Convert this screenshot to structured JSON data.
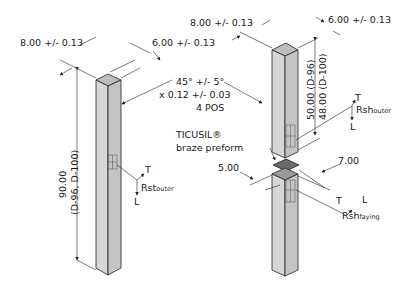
{
  "left_bar": {
    "dim_width": "8.00 +/- 0.13",
    "dim_depth": "6.00 +/- 0.13",
    "dim_length_value": "90.00",
    "dim_length_variants": "(D-96, D-100)",
    "gauge_axes": {
      "t": "T",
      "l": "L"
    },
    "gauge_label": "Rst",
    "gauge_sub": "outer"
  },
  "chamfer_note": {
    "line1": "45° +/- 5°",
    "line2": "x 0.12 +/- 0.03",
    "line3": "4 POS"
  },
  "right_assembly": {
    "dim_width": "8.00 +/- 0.13",
    "dim_depth": "6.00 +/- 0.13",
    "dim_upper_length_1": "50.00 (D-96)",
    "dim_upper_length_2": "48.00 (D-100)",
    "upper_gauge_axes": {
      "t": "T",
      "l": "L"
    },
    "upper_gauge_label": "Rsh",
    "upper_gauge_sub": "outer",
    "preform_label_line1": "TICUSIL®",
    "preform_label_line2": "braze preform",
    "dim_preform_a": "7.00",
    "dim_preform_b": "5.00",
    "lower_gauge_axes": {
      "t": "T",
      "l": "L"
    },
    "lower_gauge_label": "Rsh",
    "lower_gauge_sub": "faying"
  },
  "colors": {
    "bar_front": "#d4d4d4",
    "bar_side": "#c2c2c2",
    "bar_top": "#bdbdbd",
    "preform": "#6a6a6a",
    "line": "#222222"
  }
}
